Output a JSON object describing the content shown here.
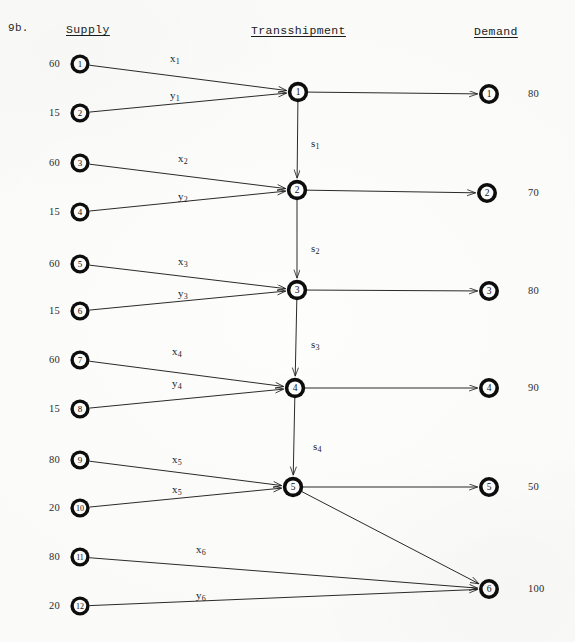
{
  "page": {
    "problem_label": "9b.",
    "background_color": "#fdfdfc",
    "ink_color": "#1b1b1b",
    "width": 575,
    "height": 642
  },
  "headers": {
    "supply": "Supply",
    "transshipment": "Transshipment",
    "demand": "Demand"
  },
  "diagram": {
    "type": "transshipment-network",
    "supply_nodes": [
      {
        "id": "1",
        "label": "1",
        "supply": "60",
        "x": 80,
        "y": 64
      },
      {
        "id": "2",
        "label": "2",
        "supply": "15",
        "x": 80,
        "y": 113
      },
      {
        "id": "3",
        "label": "3",
        "supply": "60",
        "x": 80,
        "y": 163
      },
      {
        "id": "4",
        "label": "4",
        "supply": "15",
        "x": 80,
        "y": 212
      },
      {
        "id": "5",
        "label": "5",
        "supply": "60",
        "x": 80,
        "y": 264
      },
      {
        "id": "6",
        "label": "6",
        "supply": "15",
        "x": 80,
        "y": 311
      },
      {
        "id": "7",
        "label": "7",
        "supply": "60",
        "x": 80,
        "y": 360
      },
      {
        "id": "8",
        "label": "8",
        "supply": "15",
        "x": 80,
        "y": 409
      },
      {
        "id": "9",
        "label": "9",
        "supply": "80",
        "x": 80,
        "y": 460
      },
      {
        "id": "10",
        "label": "10",
        "supply": "20",
        "x": 80,
        "y": 508
      },
      {
        "id": "11",
        "label": "11",
        "supply": "80",
        "x": 80,
        "y": 557
      },
      {
        "id": "12",
        "label": "12",
        "supply": "20",
        "x": 80,
        "y": 606
      }
    ],
    "transshipment_nodes": [
      {
        "id": "t1",
        "label": "1",
        "x": 298,
        "y": 92
      },
      {
        "id": "t2",
        "label": "2",
        "x": 297,
        "y": 190
      },
      {
        "id": "t3",
        "label": "3",
        "x": 297,
        "y": 290
      },
      {
        "id": "t4",
        "label": "4",
        "x": 295,
        "y": 388
      },
      {
        "id": "t5",
        "label": "5",
        "x": 293,
        "y": 487
      }
    ],
    "demand_nodes": [
      {
        "id": "d1",
        "label": "1",
        "demand": "80",
        "x": 489,
        "y": 94
      },
      {
        "id": "d2",
        "label": "2",
        "demand": "70",
        "x": 487,
        "y": 193
      },
      {
        "id": "d3",
        "label": "3",
        "demand": "80",
        "x": 489,
        "y": 291
      },
      {
        "id": "d4",
        "label": "4",
        "demand": "90",
        "x": 489,
        "y": 388
      },
      {
        "id": "d5",
        "label": "5",
        "demand": "50",
        "x": 489,
        "y": 487
      },
      {
        "id": "d6",
        "label": "6",
        "demand": "100",
        "x": 489,
        "y": 589
      }
    ],
    "supply_edge_labels": [
      {
        "var": "x",
        "sub": "1",
        "x": 170,
        "y": 52,
        "from": "1",
        "to": "t1"
      },
      {
        "var": "y",
        "sub": "1",
        "x": 170,
        "y": 89,
        "from": "2",
        "to": "t1"
      },
      {
        "var": "x",
        "sub": "2",
        "x": 178,
        "y": 152,
        "from": "3",
        "to": "t2"
      },
      {
        "var": "y",
        "sub": "2",
        "x": 178,
        "y": 190,
        "from": "4",
        "to": "t2"
      },
      {
        "var": "x",
        "sub": "3",
        "x": 178,
        "y": 255,
        "from": "5",
        "to": "t3"
      },
      {
        "var": "y",
        "sub": "3",
        "x": 178,
        "y": 287,
        "from": "6",
        "to": "t3"
      },
      {
        "var": "x",
        "sub": "4",
        "x": 172,
        "y": 345,
        "from": "7",
        "to": "t4"
      },
      {
        "var": "y",
        "sub": "4",
        "x": 172,
        "y": 377,
        "from": "8",
        "to": "t4"
      },
      {
        "var": "x",
        "sub": "5",
        "x": 172,
        "y": 453,
        "from": "9",
        "to": "t5"
      },
      {
        "var": "x",
        "sub": "5",
        "x": 172,
        "y": 483,
        "from": "10",
        "to": "t5"
      },
      {
        "var": "x",
        "sub": "6",
        "x": 196,
        "y": 543,
        "from": "11",
        "to": "d6"
      },
      {
        "var": "y",
        "sub": "6",
        "x": 196,
        "y": 589,
        "from": "12",
        "to": "d6"
      }
    ],
    "chain_edge_labels": [
      {
        "var": "s",
        "sub": "1",
        "x": 311,
        "y": 137,
        "from": "t1",
        "to": "t2"
      },
      {
        "var": "s",
        "sub": "2",
        "x": 311,
        "y": 242,
        "from": "t2",
        "to": "t3"
      },
      {
        "var": "s",
        "sub": "3",
        "x": 311,
        "y": 338,
        "from": "t3",
        "to": "t4"
      },
      {
        "var": "s",
        "sub": "4",
        "x": 313,
        "y": 440,
        "from": "t4",
        "to": "t5"
      }
    ]
  }
}
